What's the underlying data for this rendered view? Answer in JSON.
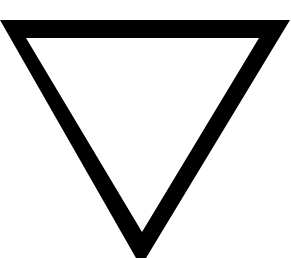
{
  "figure": {
    "shape": "inverted-triangle-outline-icon",
    "fill_color": "#000000",
    "background_color": "#ffffff",
    "interior_color": "#ffffff"
  }
}
